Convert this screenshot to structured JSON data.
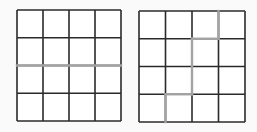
{
  "canvas": {
    "width": 257,
    "height": 132,
    "background": "#fafafa"
  },
  "colors": {
    "cell_fill": "#ffffff",
    "grid_line": "#2a2a2a",
    "highlight_line": "#a3a3a3"
  },
  "grids": [
    {
      "id": "left-grid",
      "rows": 4,
      "cols": 4,
      "x": 17,
      "y": 10,
      "width": 104,
      "height": 111,
      "highlight_segments": [
        {
          "orientation": "h",
          "line_index": 2,
          "from": 0,
          "to": 4
        }
      ]
    },
    {
      "id": "right-grid",
      "rows": 4,
      "cols": 4,
      "x": 139,
      "y": 11,
      "width": 106,
      "height": 111,
      "highlight_segments": [
        {
          "orientation": "v",
          "line_index": 3,
          "from": 0,
          "to": 1
        },
        {
          "orientation": "h",
          "line_index": 1,
          "from": 2,
          "to": 3
        },
        {
          "orientation": "v",
          "line_index": 2,
          "from": 1,
          "to": 3
        },
        {
          "orientation": "h",
          "line_index": 3,
          "from": 1,
          "to": 2
        },
        {
          "orientation": "v",
          "line_index": 1,
          "from": 3,
          "to": 4
        }
      ]
    }
  ]
}
